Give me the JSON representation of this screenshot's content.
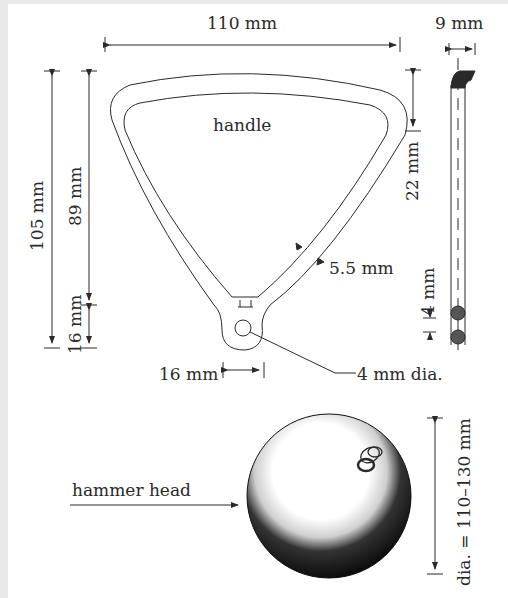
{
  "diagram": {
    "colors": {
      "ink": "#2a2a2a",
      "background": "#ffffff",
      "margin": "#e9e9e9"
    },
    "handle": {
      "label": "handle",
      "width_label": "110 mm",
      "total_height_label": "105 mm",
      "inner_height_label": "89 mm",
      "loop_height_label": "16 mm",
      "loop_width_label": "16 mm",
      "grip_thickness_label": "5.5 mm",
      "hole_label": "4 mm dia."
    },
    "side_view": {
      "width_label": "9 mm",
      "grip_depth_label": "22 mm",
      "wire_spacing_label": "4 mm"
    },
    "hammer_head": {
      "label": "hammer head",
      "diameter_label": "dia. = 110–130 mm"
    }
  }
}
